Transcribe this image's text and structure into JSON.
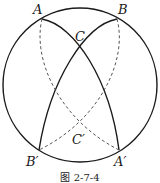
{
  "figure": {
    "caption": "图 2-7-4",
    "colors": {
      "stroke": "#1a1a1a",
      "dashed": "#555555",
      "background": "#ffffff"
    },
    "circle": {
      "cx": 80,
      "cy": 85,
      "r": 77
    },
    "points": [
      {
        "id": "A",
        "label": "A",
        "x": 42,
        "y": 19,
        "lx": 33,
        "ly": 14
      },
      {
        "id": "B",
        "label": "B",
        "x": 117,
        "y": 19,
        "lx": 118,
        "ly": 14
      },
      {
        "id": "C",
        "label": "C",
        "x": 79,
        "y": 50,
        "lx": 75,
        "ly": 41
      },
      {
        "id": "C_prime",
        "label": "C′",
        "x": 80,
        "y": 124,
        "lx": 72,
        "ly": 144
      },
      {
        "id": "B_prime",
        "label": "B′",
        "x": 39,
        "y": 150,
        "lx": 26,
        "ly": 166
      },
      {
        "id": "A_prime",
        "label": "A′",
        "x": 119,
        "y": 150,
        "lx": 114,
        "ly": 166
      }
    ]
  }
}
